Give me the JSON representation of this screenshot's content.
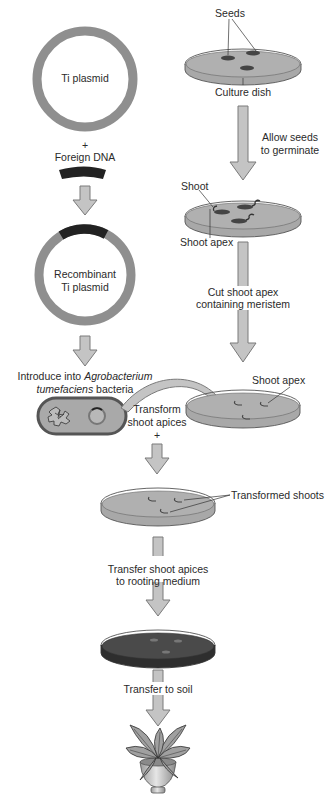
{
  "colors": {
    "plasmid_ring": "#8f8f8f",
    "foreign_dna": "#222222",
    "arrow_fill": "#c4c4c4",
    "arrow_stroke": "#7a7a7a",
    "dish_medium": "#a8a8a8",
    "dish_dark_medium": "#4a4a4a",
    "bacterium_body": "#a9a9a9",
    "bacterium_outline": "#555555"
  },
  "left_column": {
    "ti_plasmid_label": "Ti  plasmid",
    "plus": "+",
    "foreign_dna_label": "Foreign DNA",
    "recombinant_line1": "Recombinant",
    "recombinant_line2": "Ti  plasmid",
    "introduce_line1_prefix": "Introduce into ",
    "introduce_line1_italic": "Agrobacterium",
    "introduce_line2_italic": "tumefaciens",
    "introduce_line2_suffix": " bacteria"
  },
  "right_column": {
    "seeds_label": "Seeds",
    "culture_dish_label": "Culture dish",
    "germinate_line1": "Allow seeds",
    "germinate_line2": "to germinate",
    "shoot_label": "Shoot",
    "shoot_apex_label": "Shoot apex",
    "cut_line1": "Cut shoot apex",
    "cut_line2": "containing meristem",
    "shoot_apex_label_2": "Shoot apex"
  },
  "center_column": {
    "transform_line1": "Transform",
    "transform_line2": "shoot apices",
    "plus": "+",
    "transformed_shoots_label": "Transformed shoots",
    "rooting_line1": "Transfer shoot apices",
    "rooting_line2": "to rooting medium",
    "soil_label": "Transfer to soil"
  }
}
